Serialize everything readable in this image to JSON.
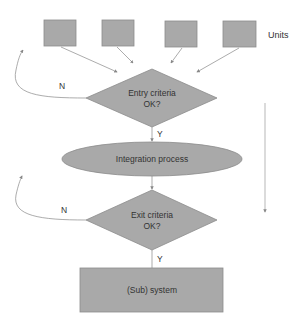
{
  "colors": {
    "shape_fill": "#a9a9a9",
    "shape_stroke": "#8c8c8c",
    "line": "#888888",
    "text": "#333333"
  },
  "units": {
    "label": "Units",
    "boxes": [
      {
        "name": "unit-1"
      },
      {
        "name": "unit-2"
      },
      {
        "name": "unit-3"
      },
      {
        "name": "unit-4"
      }
    ]
  },
  "entry_decision": {
    "line1": "Entry criteria",
    "line2": "OK?",
    "no_label": "N",
    "yes_label": "Y"
  },
  "process": {
    "label": "Integration process"
  },
  "exit_decision": {
    "line1": "Exit criteria",
    "line2": "OK?",
    "no_label": "N",
    "yes_label": "Y"
  },
  "result": {
    "label": "(Sub) system"
  }
}
